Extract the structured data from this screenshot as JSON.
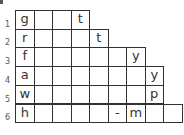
{
  "puzzle": {
    "rows": [
      {
        "label": "1",
        "cells": [
          "g",
          "",
          "",
          "t"
        ]
      },
      {
        "label": "2",
        "cells": [
          "r",
          "",
          "",
          "",
          "t"
        ]
      },
      {
        "label": "3",
        "cells": [
          "f",
          "",
          "",
          "",
          "",
          "",
          "y"
        ]
      },
      {
        "label": "4",
        "cells": [
          "a",
          "",
          "",
          "",
          "",
          "",
          "",
          "y"
        ]
      },
      {
        "label": "5",
        "cells": [
          "w",
          "",
          "",
          "",
          "",
          "",
          "",
          "p"
        ]
      },
      {
        "label": "6",
        "cells": [
          "h",
          "",
          "",
          "",
          "",
          "-",
          "m",
          "",
          ""
        ]
      }
    ]
  },
  "layout": {
    "left": 15,
    "top": 10,
    "cell_w": 18.5,
    "cell_h": 18.7,
    "border_color": "#333333",
    "text_color": "#333333"
  }
}
